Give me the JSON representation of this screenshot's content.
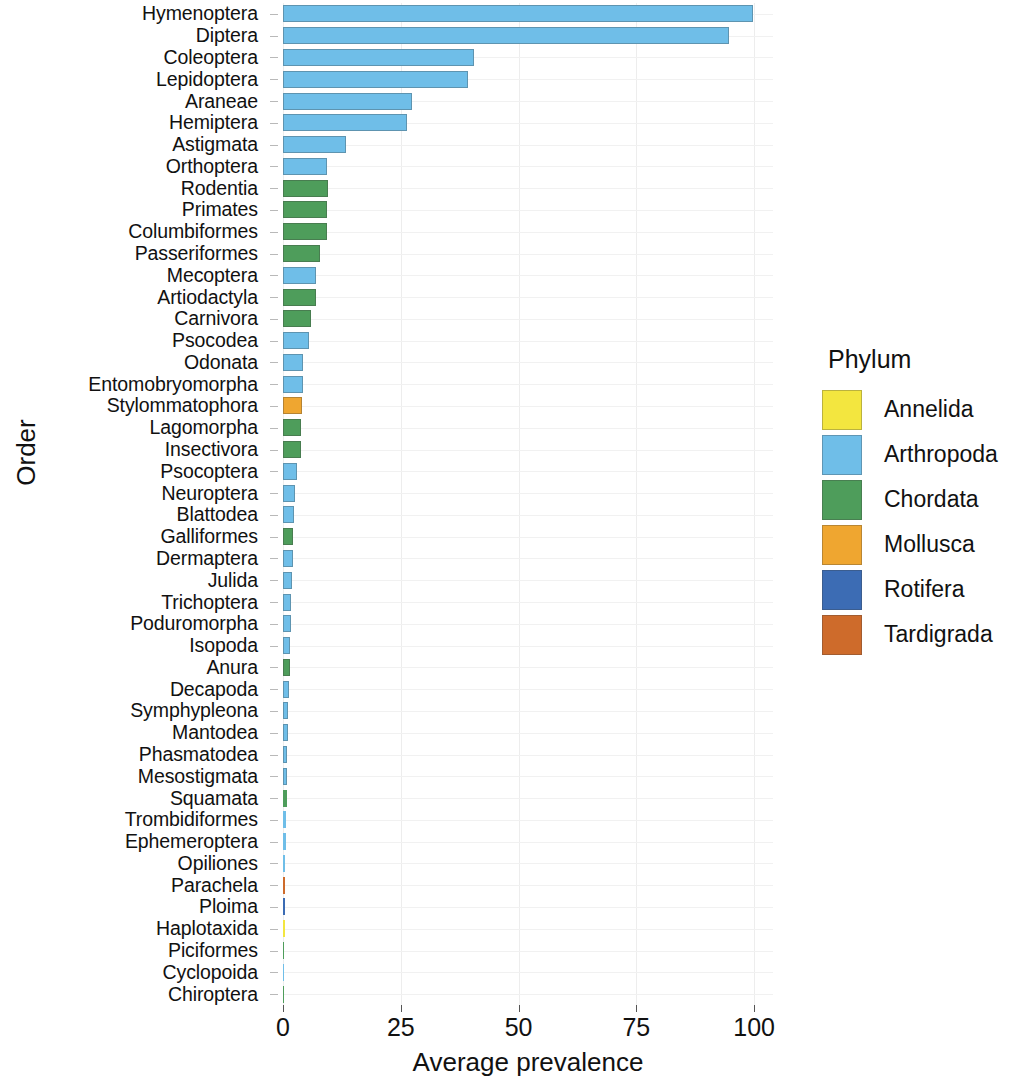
{
  "chart_data": {
    "type": "bar",
    "orientation": "horizontal",
    "title": "",
    "xlabel": "Average prevalence",
    "ylabel": "Order",
    "xlim": [
      0,
      104
    ],
    "xticks": [
      0,
      25,
      50,
      75,
      100
    ],
    "xtick_labels": [
      "0",
      "25",
      "50",
      "75",
      "100"
    ],
    "grid": true,
    "grid_axis": "both",
    "legend": {
      "title": "Phylum",
      "position": "right",
      "entries": [
        {
          "label": "Annelida",
          "color": "#F3E63F"
        },
        {
          "label": "Arthropoda",
          "color": "#6FBEE8"
        },
        {
          "label": "Chordata",
          "color": "#4E9D5B"
        },
        {
          "label": "Mollusca",
          "color": "#EFA630"
        },
        {
          "label": "Rotifera",
          "color": "#3C6CB4"
        },
        {
          "label": "Tardigrada",
          "color": "#CE6B2B"
        }
      ]
    },
    "categories": [
      "Hymenoptera",
      "Diptera",
      "Coleoptera",
      "Lepidoptera",
      "Araneae",
      "Hemiptera",
      "Astigmata",
      "Orthoptera",
      "Rodentia",
      "Primates",
      "Columbiformes",
      "Passeriformes",
      "Mecoptera",
      "Artiodactyla",
      "Carnivora",
      "Psocodea",
      "Odonata",
      "Entomobryomorpha",
      "Stylommatophora",
      "Lagomorpha",
      "Insectivora",
      "Psocoptera",
      "Neuroptera",
      "Blattodea",
      "Galliformes",
      "Dermaptera",
      "Julida",
      "Trichoptera",
      "Poduromorpha",
      "Isopoda",
      "Anura",
      "Decapoda",
      "Symphypleona",
      "Mantodea",
      "Phasmatodea",
      "Mesostigmata",
      "Squamata",
      "Trombidiformes",
      "Ephemeroptera",
      "Opiliones",
      "Parachela",
      "Ploima",
      "Haplotaxida",
      "Piciformes",
      "Cyclopoida",
      "Chiroptera"
    ],
    "values": [
      99.8,
      94.6,
      40.5,
      39.2,
      27.4,
      26.3,
      13.4,
      9.4,
      9.5,
      9.4,
      9.3,
      7.8,
      7.1,
      7.1,
      5.9,
      5.5,
      4.3,
      4.2,
      4.1,
      3.9,
      3.8,
      2.9,
      2.6,
      2.3,
      2.2,
      2.1,
      1.9,
      1.8,
      1.7,
      1.5,
      1.4,
      1.2,
      1.1,
      1.0,
      0.9,
      0.85,
      0.8,
      0.7,
      0.6,
      0.5,
      0.45,
      0.4,
      0.35,
      0.3,
      0.25,
      0.2
    ],
    "phylum": [
      "Arthropoda",
      "Arthropoda",
      "Arthropoda",
      "Arthropoda",
      "Arthropoda",
      "Arthropoda",
      "Arthropoda",
      "Arthropoda",
      "Chordata",
      "Chordata",
      "Chordata",
      "Chordata",
      "Arthropoda",
      "Chordata",
      "Chordata",
      "Arthropoda",
      "Arthropoda",
      "Arthropoda",
      "Mollusca",
      "Chordata",
      "Chordata",
      "Arthropoda",
      "Arthropoda",
      "Arthropoda",
      "Chordata",
      "Arthropoda",
      "Arthropoda",
      "Arthropoda",
      "Arthropoda",
      "Arthropoda",
      "Chordata",
      "Arthropoda",
      "Arthropoda",
      "Arthropoda",
      "Arthropoda",
      "Arthropoda",
      "Chordata",
      "Arthropoda",
      "Arthropoda",
      "Arthropoda",
      "Tardigrada",
      "Rotifera",
      "Annelida",
      "Chordata",
      "Arthropoda",
      "Chordata"
    ]
  }
}
